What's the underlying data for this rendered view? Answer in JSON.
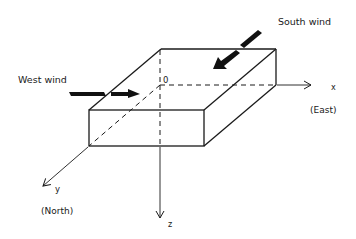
{
  "diagram": {
    "labels": {
      "south_wind": "South wind",
      "west_wind": "West wind",
      "origin": "0",
      "x_axis": "x",
      "x_direction": "(East)",
      "y_axis": "y",
      "y_direction": "(North)",
      "z_axis": "z"
    },
    "colors": {
      "line": "#1a1a1a",
      "background": "#ffffff"
    }
  }
}
